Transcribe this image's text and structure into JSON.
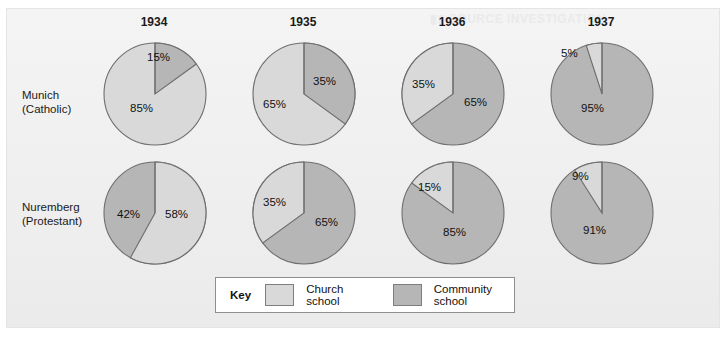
{
  "figure": {
    "row_labels": [
      {
        "name": "munich",
        "line1": "Munich",
        "line2": "(Catholic)"
      },
      {
        "name": "nuremberg",
        "line1": "Nuremberg",
        "line2": "(Protestant)"
      }
    ],
    "years": [
      "1934",
      "1935",
      "1936",
      "1937"
    ]
  },
  "key": {
    "title": "Key",
    "entries": [
      {
        "name": "church-school",
        "label": "Church school",
        "color": "#d9d9d9"
      },
      {
        "name": "community-school",
        "label": "Community school",
        "color": "#b6b6b6"
      }
    ]
  },
  "colors": {
    "church_school": "#d9d9d9",
    "community_school": "#b6b6b6",
    "pie_outline": "#6e6e6e",
    "panel_background": "#f1f1f1",
    "text": "#1a1a1a"
  },
  "chart_data": {
    "type": "pie",
    "categories": [
      "Church school",
      "Community school"
    ],
    "x": [
      "1934",
      "1935",
      "1936",
      "1937"
    ],
    "legend_position": "bottom",
    "grid": false,
    "units": "percent",
    "series": [
      {
        "name": "Munich (Catholic)",
        "pies": [
          {
            "year": "1934",
            "church_school": 85,
            "community_school": 15,
            "labels": [
              {
                "text": "15%",
                "slice": "community-school"
              },
              {
                "text": "85%",
                "slice": "church-school"
              }
            ]
          },
          {
            "year": "1935",
            "church_school": 65,
            "community_school": 35,
            "labels": [
              {
                "text": "35%",
                "slice": "community-school"
              },
              {
                "text": "65%",
                "slice": "church-school"
              }
            ]
          },
          {
            "year": "1936",
            "church_school": 35,
            "community_school": 65,
            "labels": [
              {
                "text": "35%",
                "slice": "church-school"
              },
              {
                "text": "65%",
                "slice": "community-school"
              }
            ]
          },
          {
            "year": "1937",
            "church_school": 5,
            "community_school": 95,
            "labels": [
              {
                "text": "5%",
                "slice": "church-school"
              },
              {
                "text": "95%",
                "slice": "community-school"
              }
            ]
          }
        ]
      },
      {
        "name": "Nuremberg (Protestant)",
        "pies": [
          {
            "year": "1934",
            "church_school": 58,
            "community_school": 42,
            "labels": [
              {
                "text": "42%",
                "slice": "community-school"
              },
              {
                "text": "58%",
                "slice": "church-school"
              }
            ]
          },
          {
            "year": "1935",
            "church_school": 35,
            "community_school": 65,
            "labels": [
              {
                "text": "35%",
                "slice": "church-school"
              },
              {
                "text": "65%",
                "slice": "community-school"
              }
            ]
          },
          {
            "year": "1936",
            "church_school": 15,
            "community_school": 85,
            "labels": [
              {
                "text": "15%",
                "slice": "church-school"
              },
              {
                "text": "85%",
                "slice": "community-school"
              }
            ]
          },
          {
            "year": "1937",
            "church_school": 9,
            "community_school": 91,
            "labels": [
              {
                "text": "9%",
                "slice": "church-school"
              },
              {
                "text": "91%",
                "slice": "community-school"
              }
            ]
          }
        ]
      }
    ]
  }
}
